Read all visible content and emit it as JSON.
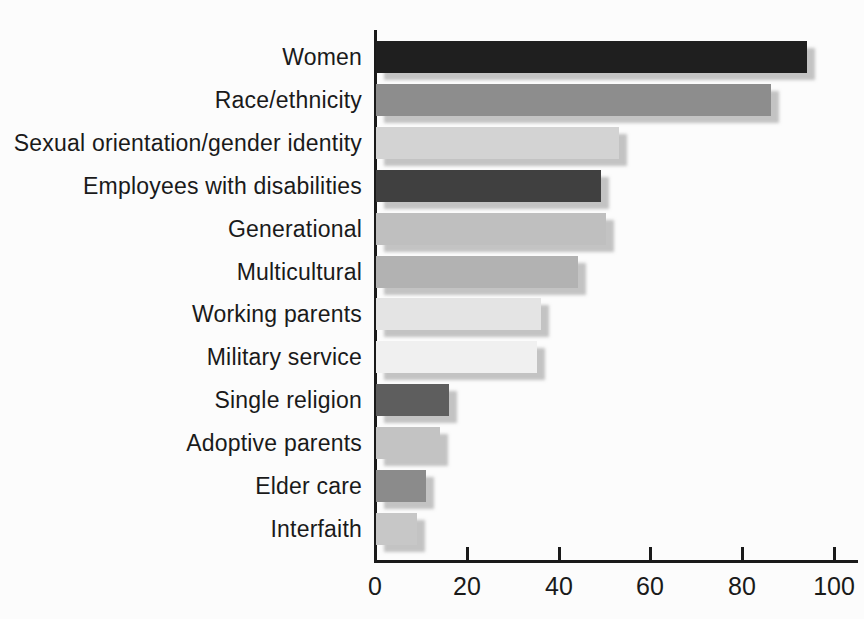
{
  "chart_data": {
    "type": "bar",
    "orientation": "horizontal",
    "title": "",
    "xlabel": "",
    "ylabel": "",
    "xlim": [
      0,
      100
    ],
    "xticks": [
      0,
      20,
      40,
      60,
      80,
      100
    ],
    "grid": false,
    "legend": false,
    "categories": [
      "Women",
      "Race/ethnicity",
      "Sexual orientation/gender identity",
      "Employees with disabilities",
      "Generational",
      "Multicultural",
      "Working parents",
      "Military service",
      "Single religion",
      "Adoptive parents",
      "Elder care",
      "Interfaith"
    ],
    "values": [
      94,
      86,
      53,
      49,
      50,
      44,
      36,
      35,
      16,
      14,
      11,
      9
    ],
    "bar_colors": [
      "#1f1f1f",
      "#8d8d8d",
      "#d3d3d3",
      "#404040",
      "#bfbfbf",
      "#b2b2b2",
      "#e4e4e4",
      "#f0f0f0",
      "#5e5e5e",
      "#c3c3c3",
      "#8b8b8b",
      "#c7c7c7"
    ],
    "axis_color": "#1a1a1a",
    "background_color": "#fcfcfc"
  }
}
